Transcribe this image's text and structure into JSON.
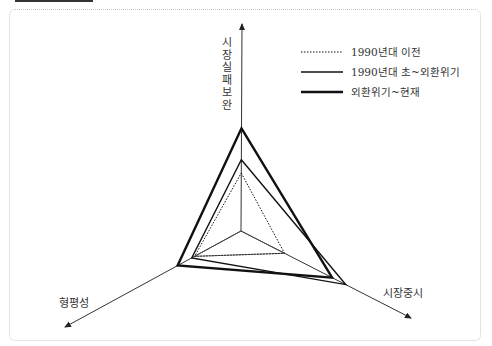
{
  "chart_data": {
    "type": "radar",
    "title": "",
    "axes": [
      {
        "key": "market_failure",
        "label": "시장실패보완",
        "label_vertical": [
          "시",
          "장",
          "실",
          "패",
          "보",
          "완"
        ]
      },
      {
        "key": "market_oriented",
        "label": "시장중시"
      },
      {
        "key": "equity",
        "label": "형평성"
      }
    ],
    "axis_max": 1.0,
    "series": [
      {
        "name": "1990년대 이전",
        "style": "dotted",
        "values": {
          "market_failure": 0.35,
          "market_oriented": 0.32,
          "equity": 0.33
        }
      },
      {
        "name": "1990년대 초~외환위기",
        "style": "solid",
        "values": {
          "market_failure": 0.43,
          "market_oriented": 0.77,
          "equity": 0.35
        }
      },
      {
        "name": "외환위기~현재",
        "style": "thick",
        "values": {
          "market_failure": 0.62,
          "market_oriented": 0.67,
          "equity": 0.45
        }
      }
    ],
    "inner_reference": {
      "market_failure": 0.0,
      "market_oriented": 0.32,
      "equity": 0.33
    },
    "legend_position": "top-right",
    "grid": false
  },
  "colors": {
    "line": "#111111",
    "axis": "#333333",
    "frame": "#c8c8c8"
  }
}
